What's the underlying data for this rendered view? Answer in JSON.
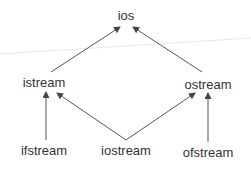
{
  "diagram": {
    "type": "class-hierarchy",
    "nodes": [
      {
        "id": "ios",
        "label": "ios",
        "x": 126,
        "y": 9
      },
      {
        "id": "istream",
        "label": "istream",
        "x": 44,
        "y": 76
      },
      {
        "id": "ostream",
        "label": "ostream",
        "x": 208,
        "y": 78
      },
      {
        "id": "ifstream",
        "label": "ifstream",
        "x": 44,
        "y": 143
      },
      {
        "id": "iostream",
        "label": "iostream",
        "x": 126,
        "y": 143
      },
      {
        "id": "ofstream",
        "label": "ofstream",
        "x": 208,
        "y": 145
      }
    ],
    "edges": [
      {
        "from": "istream",
        "to": "ios"
      },
      {
        "from": "ostream",
        "to": "ios"
      },
      {
        "from": "ifstream",
        "to": "istream"
      },
      {
        "from": "iostream",
        "to": "istream"
      },
      {
        "from": "iostream",
        "to": "ostream"
      },
      {
        "from": "ofstream",
        "to": "ostream"
      }
    ],
    "colors": {
      "text": "#333333",
      "arrow": "#555555",
      "background": "#ffffff",
      "faint_line": "#e6e6e6"
    }
  }
}
